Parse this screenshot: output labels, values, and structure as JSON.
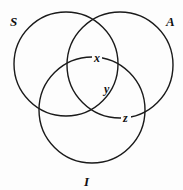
{
  "diagram": {
    "type": "venn",
    "sets": [
      {
        "id": "S",
        "label": "S",
        "cx": 66,
        "cy": 64,
        "r": 52,
        "label_x": 10,
        "label_y": 26
      },
      {
        "id": "A",
        "label": "A",
        "cx": 120,
        "cy": 65,
        "r": 53,
        "label_x": 166,
        "label_y": 26
      },
      {
        "id": "I",
        "label": "I",
        "cx": 92,
        "cy": 110,
        "r": 53,
        "label_x": 84,
        "label_y": 186
      }
    ],
    "points": [
      {
        "label": "x",
        "x": 95,
        "y": 62
      },
      {
        "label": "y",
        "x": 104,
        "y": 93
      },
      {
        "label": "z",
        "x": 124,
        "y": 122
      }
    ],
    "stroke_color": "#1a1a1a",
    "background": "#fdfdfd"
  }
}
